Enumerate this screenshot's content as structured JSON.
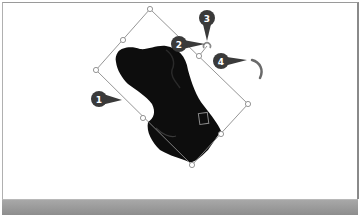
{
  "canvas": {
    "object": "dog-head-image",
    "selection": {
      "handles": [
        {
          "name": "top",
          "x": 150,
          "y": 9
        },
        {
          "name": "top-right-mid",
          "x": 199,
          "y": 56
        },
        {
          "name": "right",
          "x": 248,
          "y": 104
        },
        {
          "name": "bottom-right-mid",
          "x": 221,
          "y": 134
        },
        {
          "name": "bottom",
          "x": 192,
          "y": 165
        },
        {
          "name": "bottom-left-mid",
          "x": 143,
          "y": 118
        },
        {
          "name": "left",
          "x": 96,
          "y": 70
        },
        {
          "name": "top-left-mid",
          "x": 123,
          "y": 40
        }
      ],
      "rotation_handle": {
        "x": 207,
        "y": 46
      }
    }
  },
  "callouts": [
    {
      "number": "1",
      "label": "1"
    },
    {
      "number": "2",
      "label": "2"
    },
    {
      "number": "3",
      "label": "3"
    },
    {
      "number": "4",
      "label": "4"
    }
  ],
  "colors": {
    "callout": "#3a3a3a",
    "selection": "#8a8a8a",
    "bottom_bar": "#9a9a9a"
  }
}
